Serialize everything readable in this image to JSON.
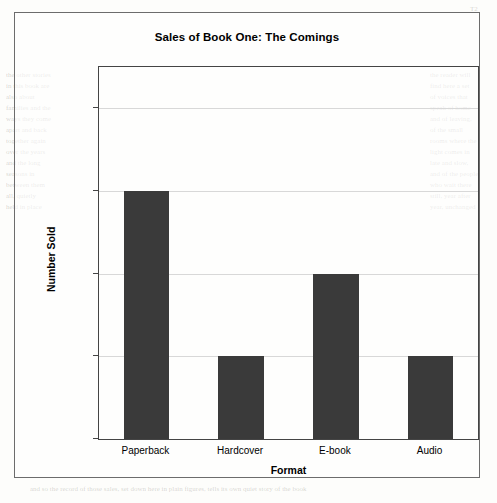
{
  "chart_data": {
    "type": "bar",
    "title": "Sales of Book One: The Comings",
    "xlabel": "Format",
    "ylabel": "Number Sold",
    "categories": [
      "Paperback",
      "Hardcover",
      "E-book",
      "Audio"
    ],
    "values": [
      30000,
      10000,
      20000,
      10000
    ],
    "ytick_labels": [
      "0",
      "10k",
      "20k",
      "30k",
      "40k"
    ],
    "ytick_values": [
      0,
      10000,
      20000,
      30000,
      40000
    ],
    "ylim": [
      0,
      45000
    ],
    "grid": "horizontal",
    "legend": "none",
    "bar_color": "#3a3a3a",
    "frame_color": "#6c6c6c",
    "grid_color": "#d8d8d8"
  },
  "page": {
    "ghost_top": "T2",
    "ghost_left": "the other stories\nin this book are\nalso about\nfamilies and the\nways they come\napart and back\ntogether again\nover the years\nand the long\nseasons in\nbetween them\nall, quietly\nheld in place",
    "ghost_right": "the reader will\nfind here a set\nof voices that\nspeak of home\nand of leaving,\nof the small\nrooms where the\nlight comes in\nlate and slow,\nand of the people\nwho wait there\nstill, year after\nyear, unchanged",
    "ghost_bottom": "and so the record of those sales, set down here in plain figures, tells its own quiet story of the book"
  }
}
